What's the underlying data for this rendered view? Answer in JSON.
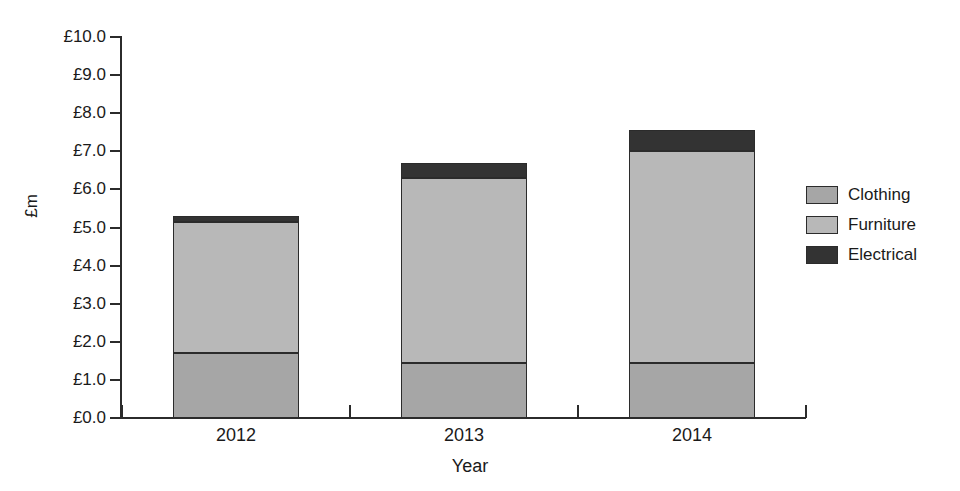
{
  "chart_data": {
    "type": "bar",
    "subtype": "stacked-bar",
    "title": "",
    "xlabel": "Year",
    "ylabel": "£m",
    "categories": [
      "2012",
      "2013",
      "2014"
    ],
    "ylim": [
      0,
      10
    ],
    "ytick_step": 1.0,
    "ytick_labels": [
      "£10.0",
      "£9.0",
      "£8.0",
      "£7.0",
      "£6.0",
      "£5.0",
      "£4.0",
      "£3.0",
      "£2.0",
      "£1.0",
      "£0.0"
    ],
    "ytick_values": [
      10.0,
      9.0,
      8.0,
      7.0,
      6.0,
      5.0,
      4.0,
      3.0,
      2.0,
      1.0,
      0.0
    ],
    "grid": false,
    "legend_position": "right",
    "series": [
      {
        "name": "Clothing",
        "color": "#a6a6a6",
        "values": [
          1.7,
          1.45,
          1.45
        ]
      },
      {
        "name": "Furniture",
        "color": "#b8b8b8",
        "values": [
          3.45,
          4.85,
          5.55
        ]
      },
      {
        "name": "Electrical",
        "color": "#333333",
        "values": [
          0.15,
          0.4,
          0.55
        ]
      }
    ],
    "totals": [
      5.3,
      6.7,
      7.55
    ],
    "stack_order_bottom_to_top": [
      "Clothing",
      "Furniture",
      "Electrical"
    ]
  },
  "legend": {
    "items": [
      {
        "label": "Clothing",
        "color": "#a6a6a6"
      },
      {
        "label": "Furniture",
        "color": "#b8b8b8"
      },
      {
        "label": "Electrical",
        "color": "#333333"
      }
    ]
  },
  "axes": {
    "y_title": "£m",
    "x_title": "Year"
  }
}
